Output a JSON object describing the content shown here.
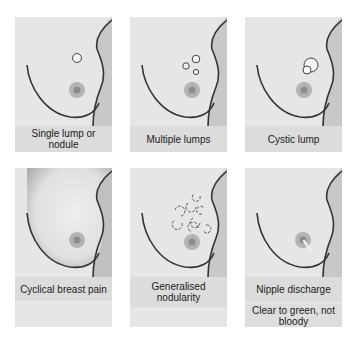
{
  "figure": {
    "panels": [
      {
        "id": "single-lump",
        "caption": "Single lump or nodule",
        "feature": "single-lump"
      },
      {
        "id": "multiple-lumps",
        "caption": "Multiple lumps",
        "feature": "multiple-lumps"
      },
      {
        "id": "cystic-lump",
        "caption": "Cystic lump",
        "feature": "cystic-lump"
      },
      {
        "id": "cyclical-breast-pain",
        "caption": "Cyclical breast pain",
        "feature": "shaded-breast"
      },
      {
        "id": "generalised-nodularity",
        "caption": "Generalised nodularity",
        "feature": "nodularity"
      },
      {
        "id": "nipple-discharge",
        "caption": "Nipple discharge",
        "subcaption": "Clear to green, not bloody",
        "feature": "discharge"
      }
    ]
  },
  "colors": {
    "panel_bg": "#e6e6e6",
    "caption_bg": "#dcdcdc",
    "outline": "#333333",
    "areola": "#b0b0b0",
    "nipple": "#8c8c8c",
    "body_shadow": "#c4c4c4"
  }
}
